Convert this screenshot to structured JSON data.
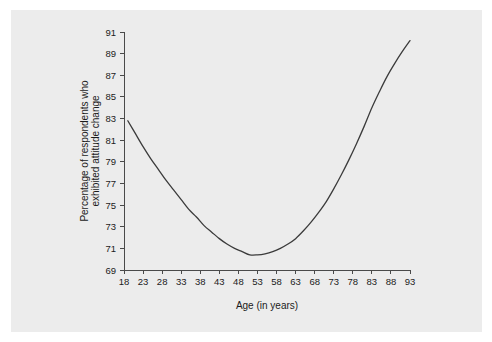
{
  "chart_data": {
    "type": "line",
    "title": "",
    "xlabel": "Age (in years)",
    "ylabel": "Percentage of respondents who exhibited attitude change",
    "ylabel_lines": [
      "Percentage of respondents who",
      "exhibited attitude change"
    ],
    "xlim": [
      18,
      93
    ],
    "ylim": [
      69,
      91
    ],
    "grid": false,
    "legend": null,
    "xticks": [
      18,
      23,
      28,
      33,
      38,
      43,
      48,
      53,
      58,
      63,
      68,
      73,
      78,
      83,
      88,
      93
    ],
    "yticks": [
      69,
      71,
      73,
      75,
      77,
      79,
      81,
      83,
      85,
      87,
      89,
      91
    ],
    "series": [
      {
        "name": "Attitude change by age",
        "x": [
          19,
          21,
          23,
          25,
          27,
          29,
          31,
          33,
          35,
          37,
          39,
          41,
          43,
          45,
          47,
          49,
          51,
          53,
          55,
          57,
          59,
          61,
          63,
          65,
          67,
          69,
          71,
          73,
          75,
          77,
          79,
          81,
          83,
          85,
          87,
          89,
          91,
          93
        ],
        "values": [
          82.8,
          81.6,
          80.4,
          79.3,
          78.3,
          77.3,
          76.4,
          75.5,
          74.6,
          73.9,
          73.1,
          72.5,
          71.9,
          71.4,
          71.0,
          70.7,
          70.4,
          70.4,
          70.5,
          70.7,
          71.0,
          71.4,
          71.9,
          72.6,
          73.4,
          74.3,
          75.3,
          76.5,
          77.8,
          79.2,
          80.7,
          82.3,
          84.0,
          85.5,
          86.9,
          88.1,
          89.2,
          90.2
        ]
      }
    ],
    "colors": {
      "curve": "#3b3b3b",
      "axis": "#4a4a4a",
      "panel_background": "#ececec",
      "figure_background": "#ffffff",
      "text": "#1b1b1b"
    }
  }
}
